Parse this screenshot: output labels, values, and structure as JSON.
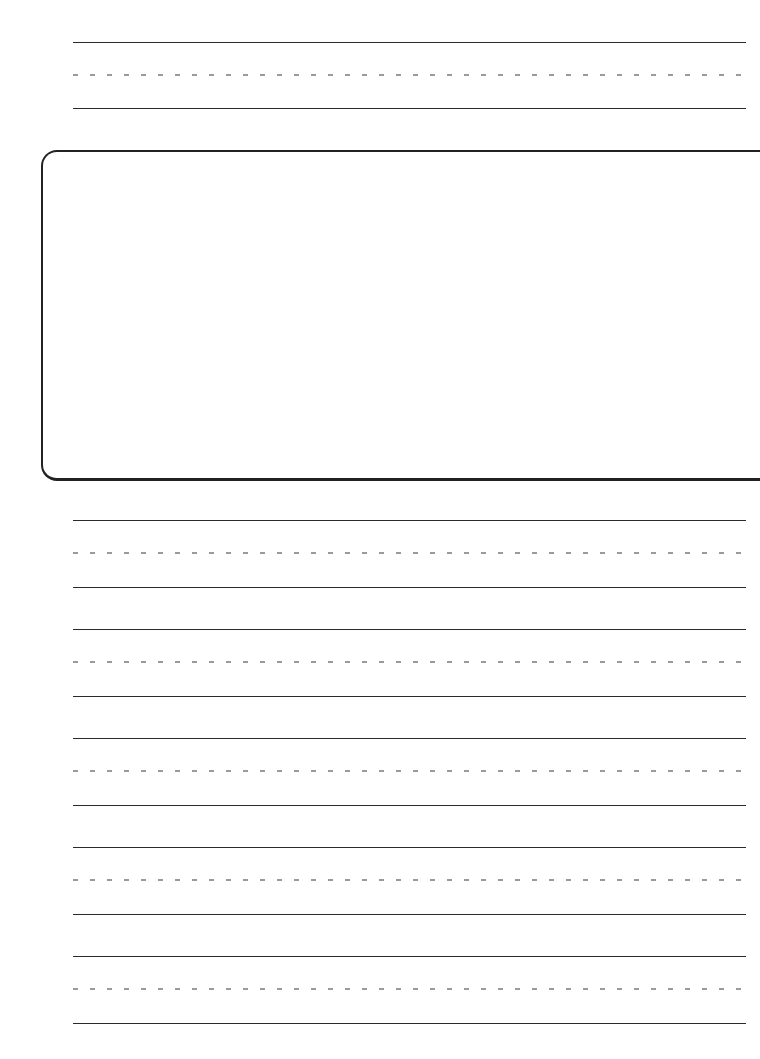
{
  "page": {
    "type": "handwriting-practice-sheet",
    "background": "#ffffff",
    "line_color": "#2a2a2a",
    "dash_color": "#9a9a9a",
    "line_left": 73,
    "line_right": 746
  },
  "top_writing_rows": [
    {
      "top": 42,
      "mid": 75,
      "base": 108
    }
  ],
  "drawing_box": {
    "left": 41,
    "top": 150,
    "bottom": 481,
    "radius": 16
  },
  "bottom_writing_rows": [
    {
      "top": 520,
      "mid": 553,
      "base": 587
    },
    {
      "top": 629,
      "mid": 662,
      "base": 696
    },
    {
      "top": 738,
      "mid": 771,
      "base": 805
    },
    {
      "top": 847,
      "mid": 880,
      "base": 914
    },
    {
      "top": 956,
      "mid": 989,
      "base": 1023
    }
  ]
}
